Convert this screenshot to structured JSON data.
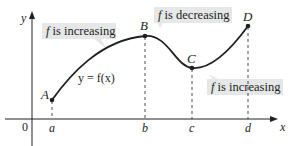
{
  "diagram": {
    "axes": {
      "x_label": "x",
      "y_label": "y",
      "origin_label": "0"
    },
    "points": [
      {
        "label": "A",
        "px": 52,
        "py": 100
      },
      {
        "label": "B",
        "px": 145,
        "py": 36
      },
      {
        "label": "C",
        "px": 192,
        "py": 68
      },
      {
        "label": "D",
        "px": 248,
        "py": 26
      }
    ],
    "x_ticks": [
      {
        "label": "a",
        "px": 52
      },
      {
        "label": "b",
        "px": 145
      },
      {
        "label": "c",
        "px": 192
      },
      {
        "label": "d",
        "px": 248
      }
    ],
    "curve_label": "y = f(x)",
    "callouts": [
      {
        "id": "increasing-1",
        "prefix": "f",
        "text": " is increasing"
      },
      {
        "id": "decreasing",
        "prefix": "f",
        "text": " is decreasing"
      },
      {
        "id": "increasing-2",
        "prefix": "f",
        "text": " is increasing"
      }
    ],
    "colors": {
      "curve": "#231f20",
      "callout_bg": "#e6e7e8",
      "axis": "#231f20",
      "dashed": "#231f20"
    }
  }
}
